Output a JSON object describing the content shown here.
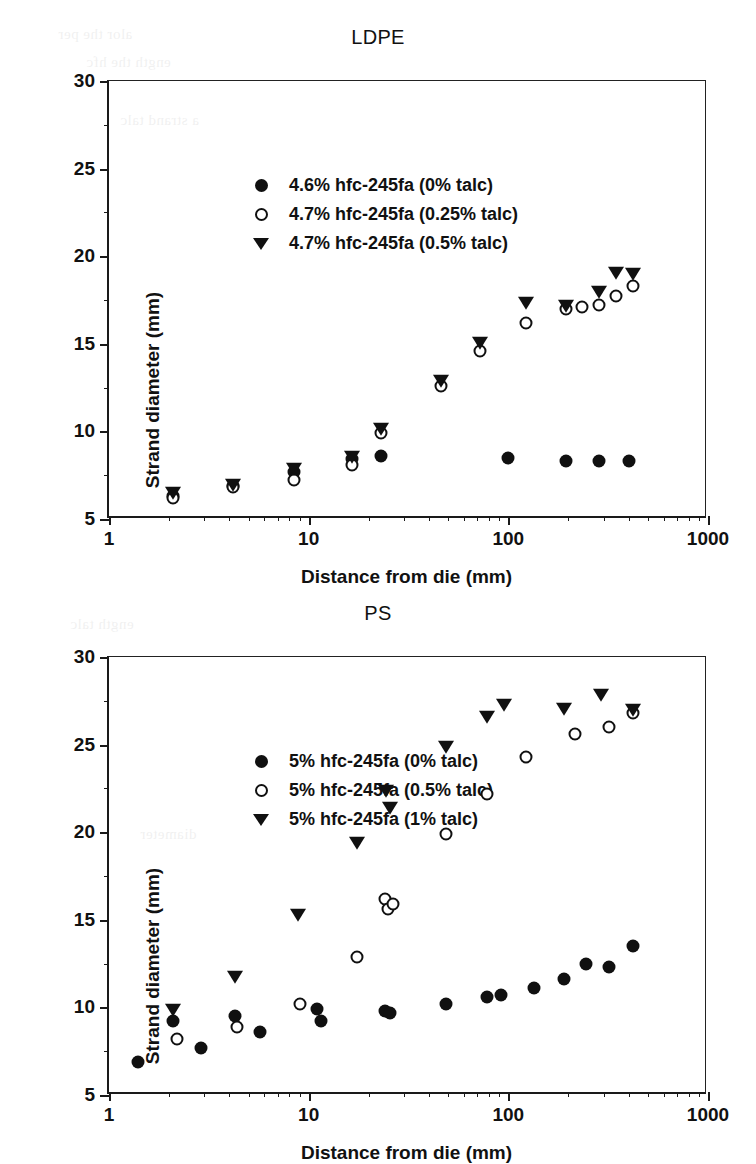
{
  "figure": {
    "axis_x_title": "Distance from die (mm)",
    "axis_y_title": "Strand diameter (mm)",
    "x_ticks": [
      "1",
      "10",
      "100",
      "1000"
    ],
    "y_ticks": [
      "5",
      "10",
      "15",
      "20",
      "25",
      "30"
    ],
    "ghost_artifacts": [
      "the per",
      "the hfc",
      "a strand",
      "talc"
    ]
  },
  "chart_data": [
    {
      "id": "ldpe",
      "type": "scatter",
      "title": "LDPE",
      "xlabel": "Distance from die (mm)",
      "ylabel": "Strand diameter (mm)",
      "xscale": "log",
      "yscale": "linear",
      "xlim": [
        1,
        1000
      ],
      "ylim": [
        5,
        30
      ],
      "yticks": [
        5,
        10,
        15,
        20,
        25,
        30
      ],
      "xticks": [
        1,
        10,
        100,
        1000
      ],
      "grid": false,
      "legend_position": "top-left",
      "series": [
        {
          "name": "4.6% hfc-245fa (0% talc)",
          "marker": "filled-circle",
          "points": [
            [
              2.1,
              6.3
            ],
            [
              4.2,
              6.9
            ],
            [
              8.4,
              7.7
            ],
            [
              16.5,
              8.4
            ],
            [
              23.0,
              8.6
            ],
            [
              100.0,
              8.5
            ],
            [
              195.0,
              8.3
            ],
            [
              285.0,
              8.3
            ],
            [
              400.0,
              8.3
            ]
          ]
        },
        {
          "name": "4.7% hfc-245fa (0.25% talc)",
          "marker": "open-circle",
          "points": [
            [
              2.1,
              6.2
            ],
            [
              4.2,
              6.8
            ],
            [
              8.4,
              7.2
            ],
            [
              16.5,
              8.1
            ],
            [
              23.0,
              9.9
            ],
            [
              46.0,
              12.6
            ],
            [
              72.0,
              14.6
            ],
            [
              122.0,
              16.2
            ],
            [
              195.0,
              17.0
            ],
            [
              235.0,
              17.1
            ],
            [
              285.0,
              17.2
            ],
            [
              345.0,
              17.7
            ],
            [
              420.0,
              18.3
            ]
          ]
        },
        {
          "name": "4.7% hfc-245fa (0.5% talc)",
          "marker": "filled-triangle-down",
          "points": [
            [
              2.1,
              6.4
            ],
            [
              4.2,
              6.9
            ],
            [
              8.4,
              7.8
            ],
            [
              16.5,
              8.5
            ],
            [
              23.0,
              10.1
            ],
            [
              46.0,
              12.8
            ],
            [
              72.0,
              15.0
            ],
            [
              122.0,
              17.3
            ],
            [
              195.0,
              17.1
            ],
            [
              285.0,
              17.9
            ],
            [
              345.0,
              19.0
            ],
            [
              420.0,
              18.9
            ]
          ]
        }
      ]
    },
    {
      "id": "ps",
      "type": "scatter",
      "title": "PS",
      "xlabel": "Distance from die (mm)",
      "ylabel": "Strand diameter (mm)",
      "xscale": "log",
      "yscale": "linear",
      "xlim": [
        1,
        1000
      ],
      "ylim": [
        5,
        30
      ],
      "yticks": [
        5,
        10,
        15,
        20,
        25,
        30
      ],
      "xticks": [
        1,
        10,
        100,
        1000
      ],
      "grid": false,
      "legend_position": "top-left",
      "series": [
        {
          "name": "5% hfc-245fa (0% talc)",
          "marker": "filled-circle",
          "points": [
            [
              1.4,
              6.9
            ],
            [
              2.1,
              9.2
            ],
            [
              2.9,
              7.7
            ],
            [
              4.3,
              9.5
            ],
            [
              5.7,
              8.6
            ],
            [
              11.0,
              9.9
            ],
            [
              11.5,
              9.2
            ],
            [
              24.0,
              9.8
            ],
            [
              25.5,
              9.7
            ],
            [
              49.0,
              10.2
            ],
            [
              78.0,
              10.6
            ],
            [
              92.0,
              10.7
            ],
            [
              135.0,
              11.1
            ],
            [
              190.0,
              11.6
            ],
            [
              245.0,
              12.5
            ],
            [
              320.0,
              12.3
            ],
            [
              420.0,
              13.5
            ]
          ]
        },
        {
          "name": "5% hfc-245fa (0.5% talc)",
          "marker": "open-circle",
          "points": [
            [
              2.2,
              8.2
            ],
            [
              4.4,
              8.9
            ],
            [
              9.0,
              10.2
            ],
            [
              17.5,
              12.9
            ],
            [
              24.0,
              16.2
            ],
            [
              25.0,
              15.6
            ],
            [
              26.5,
              15.9
            ],
            [
              49.0,
              19.9
            ],
            [
              78.0,
              22.2
            ],
            [
              122.0,
              24.3
            ],
            [
              215.0,
              25.6
            ],
            [
              320.0,
              26.0
            ],
            [
              420.0,
              26.8
            ]
          ]
        },
        {
          "name": "5% hfc-245fa (1% talc)",
          "marker": "filled-triangle-down",
          "points": [
            [
              2.1,
              9.8
            ],
            [
              4.3,
              11.7
            ],
            [
              8.8,
              15.2
            ],
            [
              17.5,
              19.3
            ],
            [
              24.5,
              22.3
            ],
            [
              25.5,
              21.3
            ],
            [
              49.0,
              24.8
            ],
            [
              78.0,
              26.5
            ],
            [
              95.0,
              27.2
            ],
            [
              190.0,
              27.0
            ],
            [
              290.0,
              27.8
            ],
            [
              420.0,
              26.9
            ]
          ]
        }
      ]
    }
  ]
}
